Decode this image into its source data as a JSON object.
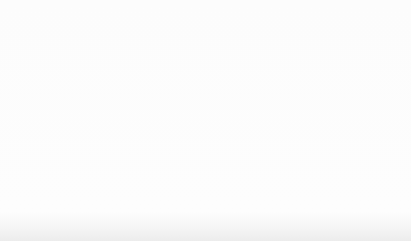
{
  "chart_data": {
    "type": "line",
    "title": "",
    "subtitle": "",
    "xlabel": "x",
    "ylabel": "Membership μ",
    "xlim": [
      0,
      6
    ],
    "ylim": [
      0,
      1.08
    ],
    "xticks": [
      "0",
      "1",
      "2",
      "3",
      "4",
      "5",
      "6"
    ],
    "xtick_values": [
      0,
      1,
      2,
      3,
      4,
      5,
      6
    ],
    "yticks": [
      "0",
      "0.2",
      "0.4",
      "0.6",
      "0.8",
      "1"
    ],
    "ytick_values": [
      0,
      0.2,
      0.4,
      0.6,
      0.8,
      1
    ],
    "grid": "dotted-both",
    "legend_position": "none",
    "annotations": [
      {
        "text": "μ",
        "sub": "1",
        "x": 0.2,
        "y": 1.04
      },
      {
        "text": "μ",
        "sub": "2",
        "x": 2.0,
        "y": 1.04
      },
      {
        "text": "μ",
        "sub": "3",
        "x": 4.0,
        "y": 1.04
      },
      {
        "text": "μ",
        "sub": "4",
        "x": 5.85,
        "y": 1.04
      }
    ],
    "series": [
      {
        "name": "μ1",
        "center": 0,
        "sigma": 0.81,
        "peak": 1.0,
        "x": [
          0,
          0.25,
          0.5,
          0.75,
          1,
          1.25,
          1.5,
          1.75,
          2,
          2.5,
          3,
          3.5,
          4,
          4.5,
          5,
          5.5,
          6
        ],
        "values": [
          1.0,
          0.953,
          0.827,
          0.652,
          0.466,
          0.304,
          0.18,
          0.097,
          0.047,
          0.008,
          0.001,
          0.0,
          0.0,
          0.0,
          0.0,
          0.0,
          0.0
        ]
      },
      {
        "name": "μ2",
        "center": 2,
        "sigma": 0.81,
        "peak": 1.0,
        "x": [
          0,
          0.5,
          1,
          1.25,
          1.5,
          1.75,
          2,
          2.25,
          2.5,
          2.75,
          3,
          3.5,
          4,
          4.5,
          5,
          5.5,
          6
        ],
        "values": [
          0.047,
          0.18,
          0.466,
          0.652,
          0.827,
          0.953,
          1.0,
          0.953,
          0.827,
          0.652,
          0.466,
          0.18,
          0.047,
          0.008,
          0.001,
          0.0,
          0.0
        ]
      },
      {
        "name": "μ3",
        "center": 4,
        "sigma": 0.81,
        "peak": 1.0,
        "x": [
          0,
          1,
          2,
          2.5,
          3,
          3.25,
          3.5,
          3.75,
          4,
          4.25,
          4.5,
          4.75,
          5,
          5.5,
          6
        ],
        "values": [
          0.0,
          0.001,
          0.047,
          0.18,
          0.466,
          0.652,
          0.827,
          0.953,
          1.0,
          0.953,
          0.827,
          0.652,
          0.466,
          0.18,
          0.047
        ]
      },
      {
        "name": "μ4",
        "center": 6,
        "sigma": 0.81,
        "peak": 1.0,
        "x": [
          0,
          1,
          2,
          3,
          3.5,
          4,
          4.5,
          5,
          5.25,
          5.5,
          5.75,
          6
        ],
        "values": [
          0.0,
          0.0,
          0.0,
          0.001,
          0.008,
          0.047,
          0.18,
          0.466,
          0.652,
          0.827,
          0.953,
          1.0
        ]
      }
    ],
    "crossover_points": [
      {
        "x": 1,
        "mu": 0.29
      },
      {
        "x": 3,
        "mu": 0.29
      },
      {
        "x": 5,
        "mu": 0.29
      }
    ],
    "colors": {
      "curve": "#111111",
      "grid": "#8c8c8c",
      "axis": "#222222",
      "background": "#fdfdfd"
    }
  }
}
